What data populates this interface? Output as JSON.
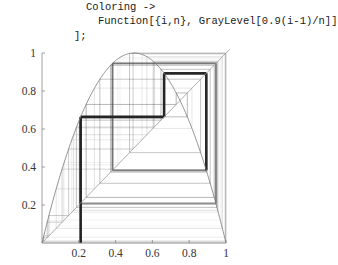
{
  "code": {
    "line1": "Coloring ->",
    "line2": "Function[{i,n}, GrayLevel[0.9(i-1)/n]]",
    "line3": "];"
  },
  "chart_data": {
    "type": "line",
    "title": "",
    "map": {
      "r": 4.0,
      "x0": 0.21,
      "iterations": 60
    },
    "series": [
      {
        "name": "logistic-parabola",
        "function": "4x(1-x)",
        "x_range": [
          0,
          1
        ]
      },
      {
        "name": "diagonal",
        "function": "x",
        "x_range": [
          0,
          1.02
        ]
      },
      {
        "name": "cobweb-path",
        "start": [
          0.21,
          0
        ],
        "first_points": [
          [
            0.21,
            0
          ],
          [
            0.21,
            0.66
          ],
          [
            0.66,
            0.66
          ],
          [
            0.66,
            0.9
          ],
          [
            0.9,
            0.9
          ]
        ]
      }
    ],
    "xlabel": "",
    "ylabel": "",
    "xlim": [
      0,
      1
    ],
    "ylim": [
      0,
      1
    ],
    "xticks": [
      "0.2",
      "0.4",
      "0.6",
      "0.8",
      "1"
    ],
    "yticks": [
      "0.2",
      "0.4",
      "0.6",
      "0.8",
      "1"
    ],
    "grid": false,
    "legend": null
  },
  "axes": {
    "x_ticks": [
      {
        "value": 0.2,
        "label": "0.2"
      },
      {
        "value": 0.4,
        "label": "0.4"
      },
      {
        "value": 0.6,
        "label": "0.6"
      },
      {
        "value": 0.8,
        "label": "0.8"
      },
      {
        "value": 1.0,
        "label": "1"
      }
    ],
    "y_ticks": [
      {
        "value": 0.2,
        "label": "0.2"
      },
      {
        "value": 0.4,
        "label": "0.4"
      },
      {
        "value": 0.6,
        "label": "0.6"
      },
      {
        "value": 0.8,
        "label": "0.8"
      },
      {
        "value": 1.0,
        "label": "1"
      }
    ]
  },
  "colors": {
    "axis": "#888888",
    "curve": "#777777",
    "diagonal": "#999999",
    "path_dark": "#222222"
  }
}
